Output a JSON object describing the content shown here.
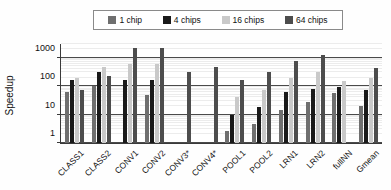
{
  "chart_data": {
    "type": "bar",
    "title": "",
    "xlabel": "",
    "ylabel": "Speedup",
    "yscale": "log",
    "ylim": [
      1,
      3000
    ],
    "ytick_labels": [
      "1",
      "10",
      "100",
      "1000"
    ],
    "ytick_values": [
      1,
      10,
      100,
      1000
    ],
    "grid": true,
    "legend_position": "top-center",
    "categories": [
      "CLASS1",
      "CLASS2",
      "CONV1",
      "CONV2",
      "CONV3*",
      "CONV4*",
      "POOL1",
      "POOL2",
      "LRN1",
      "LRN2",
      "fullNN",
      "Gmean"
    ],
    "series": [
      {
        "name": "1 chip",
        "color": "#6f6f6f",
        "values": [
          60,
          100,
          null,
          50,
          null,
          null,
          2.6,
          4.5,
          15,
          27,
          55,
          20
        ]
      },
      {
        "name": "4 chips",
        "color": "#1a1a1a",
        "values": [
          170,
          320,
          160,
          165,
          null,
          null,
          10,
          18,
          60,
          80,
          90,
          72
        ]
      },
      {
        "name": "16 chips",
        "color": "#c9c9c9",
        "values": [
          200,
          470,
          600,
          580,
          null,
          null,
          40,
          75,
          190,
          300,
          150,
          200
        ]
      },
      {
        "name": "64 chips",
        "color": "#4d4d4d",
        "values": [
          70,
          230,
          2200,
          2150,
          300,
          480,
          160,
          300,
          750,
          1200,
          null,
          420
        ]
      }
    ]
  },
  "legend": {
    "items": [
      {
        "label": "1 chip",
        "color": "#6f6f6f"
      },
      {
        "label": "4 chips",
        "color": "#1a1a1a"
      },
      {
        "label": "16 chips",
        "color": "#c9c9c9"
      },
      {
        "label": "64 chips",
        "color": "#4d4d4d"
      }
    ]
  }
}
